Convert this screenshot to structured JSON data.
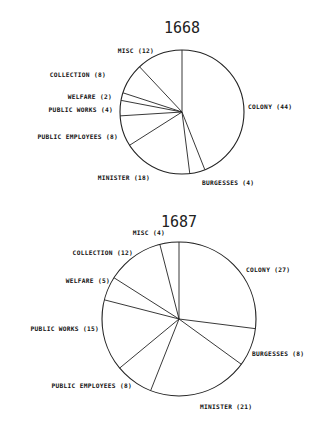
{
  "chart_data": [
    {
      "type": "pie",
      "title": "1668",
      "start_angle_deg": 0,
      "direction": "clockwise",
      "categories": [
        "COLONY",
        "BURGESSES",
        "MINISTER",
        "PUBLIC EMPLOYEES",
        "PUBLIC WORKS",
        "WELFARE",
        "COLLECTION",
        "MISC"
      ],
      "values": [
        44,
        4,
        18,
        8,
        4,
        2,
        8,
        12
      ],
      "labels": [
        "COLONY (44)",
        "BURGESSES (4)",
        "MINISTER (18)",
        "PUBLIC EMPLOYEES (8)",
        "PUBLIC WORKS (4)",
        "WELFARE (2)",
        "COLLECTION (8)",
        "MISC (12)"
      ],
      "geometry": {
        "cx": 182,
        "cy": 112,
        "r": 62
      },
      "label_pos": [
        {
          "x": 248,
          "y": 109,
          "anchor": "start"
        },
        {
          "x": 202,
          "y": 185,
          "anchor": "start"
        },
        {
          "x": 150,
          "y": 180,
          "anchor": "end"
        },
        {
          "x": 118,
          "y": 139,
          "anchor": "end"
        },
        {
          "x": 113,
          "y": 112,
          "anchor": "end"
        },
        {
          "x": 112,
          "y": 99,
          "anchor": "end"
        },
        {
          "x": 106,
          "y": 77,
          "anchor": "end"
        },
        {
          "x": 154,
          "y": 53,
          "anchor": "end"
        }
      ]
    },
    {
      "type": "pie",
      "title": "1687",
      "start_angle_deg": 0,
      "direction": "clockwise",
      "categories": [
        "COLONY",
        "BURGESSES",
        "MINISTER",
        "PUBLIC EMPLOYEES",
        "PUBLIC WORKS",
        "WELFARE",
        "COLLECTION",
        "MISC"
      ],
      "values": [
        27,
        8,
        21,
        8,
        15,
        5,
        12,
        4
      ],
      "labels": [
        "COLONY (27)",
        "BURGESSES (8)",
        "MINISTER (21)",
        "PUBLIC EMPLOYEES (8)",
        "PUBLIC WORKS (15)",
        "WELFARE (5)",
        "COLLECTION (12)",
        "MISC (4)"
      ],
      "geometry": {
        "cx": 179,
        "cy": 319,
        "r": 77
      },
      "label_pos": [
        {
          "x": 246,
          "y": 272,
          "anchor": "start"
        },
        {
          "x": 252,
          "y": 356,
          "anchor": "start"
        },
        {
          "x": 200,
          "y": 409,
          "anchor": "start"
        },
        {
          "x": 132,
          "y": 388,
          "anchor": "end"
        },
        {
          "x": 99,
          "y": 331,
          "anchor": "end"
        },
        {
          "x": 110,
          "y": 283,
          "anchor": "end"
        },
        {
          "x": 133,
          "y": 255,
          "anchor": "end"
        },
        {
          "x": 165,
          "y": 235,
          "anchor": "end"
        }
      ]
    }
  ],
  "colors": {
    "background": "#ffffff",
    "ink": "#222222"
  }
}
